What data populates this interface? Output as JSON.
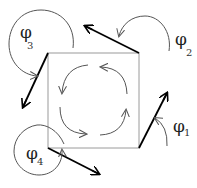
{
  "diagram": {
    "type": "rotation-vector-square",
    "square": {
      "x1": 48,
      "y1": 53,
      "x2": 139,
      "y2": 148,
      "stroke": "#999999"
    },
    "labels": [
      {
        "id": "phi1",
        "symbol": "φ",
        "subscript": "1",
        "x": 173,
        "y": 118
      },
      {
        "id": "phi2",
        "symbol": "φ",
        "subscript": "2",
        "x": 175,
        "y": 31
      },
      {
        "id": "phi3",
        "symbol": "φ",
        "subscript": "3",
        "x": 20,
        "y": 22
      },
      {
        "id": "phi4",
        "symbol": "φ",
        "subscript": "4",
        "x": 26,
        "y": 143
      }
    ],
    "corner_vectors": [
      {
        "corner": "bottom-right",
        "from": [
          139,
          148
        ],
        "to": [
          167,
          93
        ]
      },
      {
        "corner": "top-right",
        "from": [
          139,
          53
        ],
        "to": [
          85,
          26
        ]
      },
      {
        "corner": "top-left",
        "from": [
          48,
          53
        ],
        "to": [
          23,
          107
        ]
      },
      {
        "corner": "bottom-left",
        "from": [
          48,
          148
        ],
        "to": [
          99,
          174
        ]
      }
    ],
    "inner_arrows": [
      {
        "position": "top-left",
        "direction": "counterclockwise"
      },
      {
        "position": "top-right",
        "direction": "counterclockwise"
      },
      {
        "position": "bottom-left",
        "direction": "counterclockwise"
      },
      {
        "position": "bottom-right",
        "direction": "counterclockwise"
      }
    ],
    "colors": {
      "vector": "#000000",
      "arc": "#555555",
      "square": "#999999"
    }
  },
  "text": {
    "phi": "φ",
    "sub1": "1",
    "sub2": "2",
    "sub3": "3",
    "sub4": "4"
  }
}
